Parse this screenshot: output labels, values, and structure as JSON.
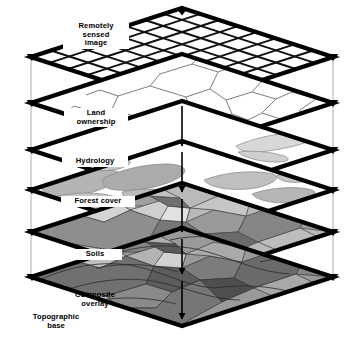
{
  "figure": {
    "kind": "gis-layer-cake-diagram",
    "title_visible": false,
    "background_color": "#ffffff",
    "ink_color": "#000000",
    "guide_line_color": "#b4b4b4"
  },
  "layers": [
    {
      "id": "remotely-sensed-image",
      "label": "Remotely\nsensed\nimage",
      "label_style": "boxed",
      "order": 1,
      "fill": "#ffffff",
      "content": "raster-grid",
      "grid_cells": 8,
      "edge_thickness_px": 4
    },
    {
      "id": "land-ownership",
      "label": "Land\nownership",
      "label_style": "boxed",
      "order": 2,
      "fill": "#ffffff",
      "content": "parcel-boundary-lines",
      "edge_thickness_px": 4
    },
    {
      "id": "hydrology",
      "label": "Hydrology",
      "label_style": "boxed",
      "order": 3,
      "fill": "#ffffff",
      "content": "water-body-polygons",
      "edge_thickness_px": 4
    },
    {
      "id": "forest-cover",
      "label": "Forest cover",
      "label_style": "boxed",
      "order": 4,
      "fill": "#ffffff",
      "content": "vegetation-polygons",
      "edge_thickness_px": 4
    },
    {
      "id": "soils",
      "label": "Soils",
      "label_style": "boxed",
      "order": 5,
      "fill": "#b9b9b9",
      "content": "soil-unit-polygons",
      "edge_thickness_px": 4
    },
    {
      "id": "composite-overlay",
      "label": "Composite\noverlay",
      "label_style": "plain",
      "order": 6,
      "fill": "#9a9a9a",
      "content": "composite-mosaic",
      "edge_thickness_px": 4
    }
  ],
  "annotations": [
    {
      "id": "topographic-base",
      "label": "Topographic\nbase",
      "label_style": "plain",
      "position": "bottom-left"
    }
  ],
  "markers": {
    "corner_marker": "down-triangle",
    "center_arrow": "down-arrow",
    "corner_marker_count_per_layer": 3,
    "vertical_guides": 2
  },
  "palette": {
    "gray_1": "#d8d8d8",
    "gray_2": "#c0c0c0",
    "gray_3": "#a8a8a8",
    "gray_4": "#8e8e8e",
    "gray_5": "#757575",
    "gray_6": "#5a5a5a",
    "gray_7": "#404040",
    "white": "#ffffff",
    "black": "#000000"
  }
}
